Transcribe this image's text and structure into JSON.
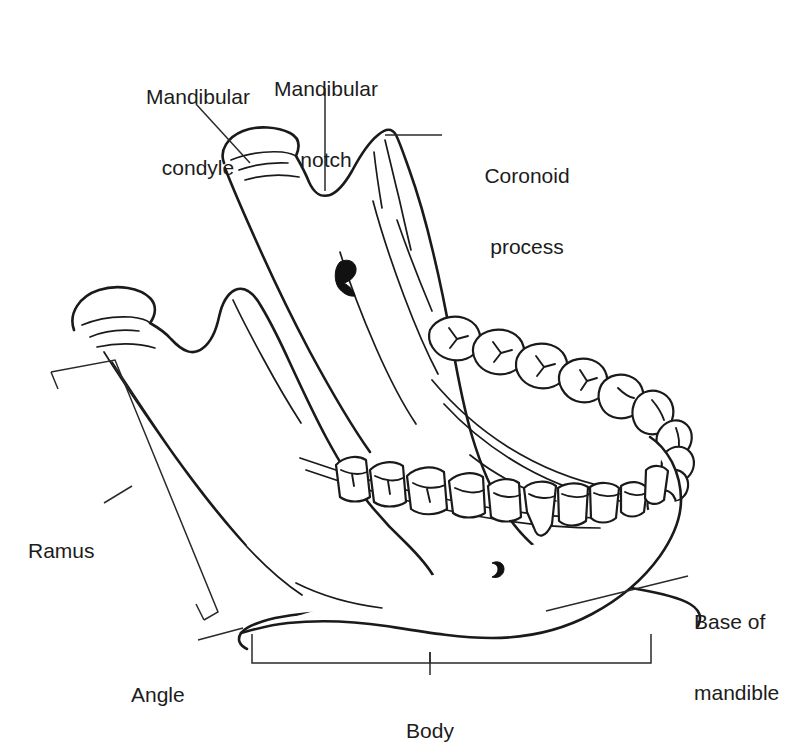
{
  "figure": {
    "subject": "mandible",
    "view": "oblique lateral view of the human mandible (lower jaw)",
    "background_color": "#ffffff",
    "line_color": "#1a1a1a",
    "leader_color": "#2a2a2a"
  },
  "labels": [
    {
      "id": "mandibular-condyle",
      "text": "Mandibular\ncondyle",
      "line1": "Mandibular",
      "line2": "condyle",
      "align": "center",
      "leader": "diagonal-down-right"
    },
    {
      "id": "mandibular-notch",
      "text": "Mandibular\nnotch",
      "line1": "Mandibular",
      "line2": "notch",
      "align": "center",
      "leader": "vertical-down"
    },
    {
      "id": "coronoid-process",
      "text": "Coronoid\nprocess",
      "line1": "Coronoid",
      "line2": "process",
      "align": "center",
      "leader": "horizontal-left"
    },
    {
      "id": "ramus",
      "text": "Ramus",
      "line1": "Ramus",
      "line2": "",
      "align": "left",
      "leader": "tilted-bracket"
    },
    {
      "id": "angle",
      "text": "Angle",
      "line1": "Angle",
      "line2": "",
      "align": "left",
      "leader": "diagonal-up-right"
    },
    {
      "id": "body",
      "text": "Body",
      "line1": "Body",
      "line2": "",
      "align": "center",
      "leader": "horizontal-bracket-above"
    },
    {
      "id": "base-of-mandible",
      "text": "Base of\nmandible",
      "line1": "Base of",
      "line2": "mandible",
      "align": "left",
      "leader": "diagonal-down-left"
    }
  ],
  "features": [
    {
      "id": "mandibular-foramen",
      "name": "mandibular foramen"
    },
    {
      "id": "mental-foramen",
      "name": "mental foramen"
    },
    {
      "id": "far-dental-arch",
      "name": "far-side dental arch (occlusal view)"
    },
    {
      "id": "near-dental-arch",
      "name": "near-side dental arch (lateral view)"
    }
  ]
}
